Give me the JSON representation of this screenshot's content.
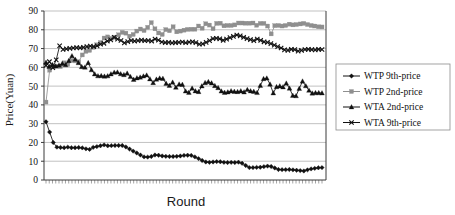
{
  "chart_data": {
    "type": "line",
    "title": "",
    "xlabel": "Round",
    "ylabel": "Price(Yuan)",
    "ylim": [
      0,
      90
    ],
    "yticks": [
      0,
      10,
      20,
      30,
      40,
      50,
      60,
      70,
      80,
      90
    ],
    "ytick_labels": [
      "0",
      "10",
      "20",
      "30",
      "40",
      "50",
      "60",
      "70",
      "80",
      "90"
    ],
    "xlim": [
      1,
      100
    ],
    "xticks_visible": true,
    "xtick_labels": [],
    "grid": "horizontal",
    "legend_position": "right",
    "series": [
      {
        "name": "WTP 9th-price",
        "marker": "diamond",
        "color": "#111111",
        "values": [
          31,
          25.5,
          20,
          17.5,
          17.3,
          17.2,
          17.5,
          17.2,
          17.2,
          17.3,
          17.1,
          16.6,
          16.3,
          17.4,
          17.8,
          18.2,
          18.7,
          18.2,
          18.3,
          18.4,
          18.4,
          18.4,
          17.6,
          16.5,
          15.4,
          14.4,
          13.3,
          12.3,
          12.2,
          12.5,
          13.3,
          13.2,
          12.8,
          12.6,
          12.5,
          12.5,
          12.6,
          12.8,
          13.1,
          13.2,
          13.1,
          12.3,
          11.4,
          10.4,
          9.6,
          9.4,
          9.6,
          9.8,
          9.7,
          9.4,
          9.3,
          9.4,
          9.3,
          9.5,
          8.9,
          7.7,
          6.6,
          6.6,
          6.7,
          6.8,
          7.1,
          7.4,
          7.2,
          6.4,
          5.6,
          5.5,
          5.5,
          5.6,
          5.4,
          5.2,
          5.0,
          4.8,
          5.4,
          5.9,
          6.2,
          6.5,
          6.6
        ]
      },
      {
        "name": "WTP 2nd-price",
        "marker": "square",
        "color": "#8f8f8f",
        "values": [
          41.5,
          58.5,
          60.2,
          60.6,
          60.4,
          62.4,
          61.5,
          63.6,
          63.4,
          63.0,
          66.6,
          68.5,
          69.0,
          70.6,
          72.0,
          73.2,
          75.6,
          76.2,
          75.4,
          76.0,
          77.3,
          78.6,
          78.2,
          76.6,
          77.5,
          79.3,
          80.4,
          79.6,
          81.3,
          83.8,
          80.5,
          78.3,
          77.5,
          80.1,
          79.5,
          81.6,
          78.9,
          79.3,
          79.8,
          80.2,
          80.3,
          80.3,
          82.0,
          80.8,
          83.2,
          82.5,
          80.6,
          83.4,
          83.5,
          82.1,
          82.3,
          82.3,
          82.6,
          83.6,
          83.6,
          83.5,
          83.5,
          83.6,
          82.4,
          83.4,
          83.4,
          82.0,
          77.8,
          82.2,
          82.3,
          82.0,
          82.3,
          83.0,
          82.6,
          82.8,
          83.1,
          83.4,
          82.8,
          82.3,
          82.0,
          81.6,
          81.5
        ]
      },
      {
        "name": "WTA 2nd-price",
        "marker": "triangle",
        "color": "#111111",
        "values": [
          62.6,
          60.4,
          61.4,
          60.6,
          61.1,
          62.0,
          61.3,
          63.5,
          66.1,
          64.2,
          62.4,
          60.3,
          60.0,
          62.4,
          58.6,
          56.4,
          55.4,
          55.5,
          55.2,
          55.4,
          56.4,
          57.3,
          57.4,
          56.5,
          56.0,
          56.8,
          55.0,
          53.5,
          54.3,
          54.7,
          55.3,
          55.8,
          53.8,
          51.8,
          53.6,
          54.2,
          54.0,
          51.4,
          50.3,
          52.0,
          49.3,
          51.0,
          50.8,
          47.3,
          46.6,
          48.8,
          47.4,
          47.0,
          50.0,
          51.8,
          52.3,
          51.6,
          50.2,
          49.1,
          47.3,
          46.6,
          46.8,
          47.4,
          47.1,
          47.0,
          47.4,
          46.8,
          48.1,
          47.4,
          47.1,
          46.5,
          50.3,
          53.9,
          54.2,
          51.0,
          46.3,
          49.6,
          50.0,
          49.5,
          51.5,
          48.8,
          45.0,
          44.8,
          48.7,
          52.6,
          50.1,
          47.7,
          46.2,
          46.4,
          46.4,
          46.3
        ]
      },
      {
        "name": "WTA 9th-price",
        "marker": "x",
        "color": "#111111",
        "values": [
          61.0,
          63.0,
          59.8,
          64.0,
          71.5,
          69.5,
          69.8,
          70.1,
          70.3,
          70.5,
          70.4,
          70.6,
          71.0,
          71.3,
          71.0,
          71.4,
          72.3,
          72.8,
          74.0,
          74.6,
          76.0,
          75.0,
          74.3,
          73.0,
          73.7,
          74.3,
          74.0,
          74.2,
          74.5,
          74.2,
          74.3,
          74.0,
          75.0,
          74.5,
          73.5,
          73.2,
          73.3,
          73.0,
          73.2,
          73.3,
          73.5,
          73.1,
          73.4,
          73.6,
          73.2,
          72.3,
          72.5,
          73.3,
          74.2,
          75.3,
          75.5,
          75.2,
          74.4,
          75.0,
          75.8,
          76.5,
          77.2,
          76.8,
          76.0,
          75.3,
          74.8,
          74.2,
          75.1,
          74.4,
          73.6,
          73.3,
          72.6,
          71.8,
          71.0,
          70.3,
          69.3,
          69.0,
          69.6,
          69.4,
          68.6,
          69.0,
          69.5,
          69.6,
          69.4,
          69.3,
          69.6,
          69.5
        ]
      }
    ]
  },
  "legend": {
    "entries": [
      {
        "label": "WTP 9th-price"
      },
      {
        "label": "WTP 2nd-price"
      },
      {
        "label": "WTA 2nd-price"
      },
      {
        "label": "WTA 9th-price"
      }
    ]
  },
  "axes": {
    "y_title": "Price(Yuan)",
    "x_title": "Round"
  }
}
